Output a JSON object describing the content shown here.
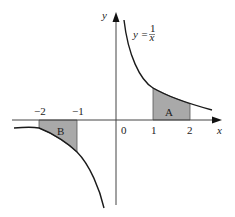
{
  "diagram": {
    "type": "function-graph",
    "function_label": {
      "lhs": "y =",
      "num": "1",
      "den": "x"
    },
    "axes": {
      "x_label": "x",
      "y_label": "y",
      "origin_label": "0"
    },
    "x_ticks": [
      {
        "value": -2,
        "label": "−2"
      },
      {
        "value": -1,
        "label": "−1"
      },
      {
        "value": 1,
        "label": "1"
      },
      {
        "value": 2,
        "label": "2"
      }
    ],
    "regions": [
      {
        "name": "A",
        "from": 1,
        "to": 2,
        "side": "above x-axis"
      },
      {
        "name": "B",
        "from": -2,
        "to": -1,
        "side": "below x-axis"
      }
    ],
    "colors": {
      "curve": "#1a1a1a",
      "axis": "#444444",
      "shade": "#a9a9a9"
    }
  }
}
